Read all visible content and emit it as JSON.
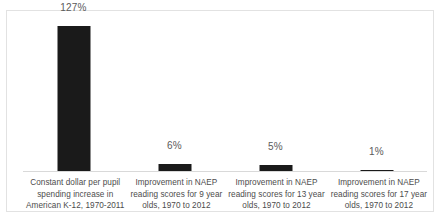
{
  "chart_data": {
    "type": "bar",
    "title": "",
    "subtitle": "",
    "xlabel": "",
    "ylabel": "",
    "grid": false,
    "legend": false,
    "axis_line": true,
    "value_labels": true,
    "ylim": [
      0,
      140
    ],
    "bar_color": "#1a1a1a",
    "label_color": "#5a5a5a",
    "axis_color": "#d9d9d9",
    "frame_color": "#e2e2e2",
    "categories": [
      "Constant dollar per pupil spending increase in American K-12, 1970-2011",
      "Improvement in NAEP reading scores for 9 year olds, 1970 to 2012",
      "Improvement in NAEP reading scores for 13 year olds, 1970 to 2012",
      "Improvement in NAEP reading scores for 17 year olds, 1970 to 2012"
    ],
    "category_lines": [
      [
        "Constant dollar per pupil",
        "spending increase in",
        "American K-12, 1970-2011"
      ],
      [
        "Improvement in NAEP",
        "reading scores for 9 year",
        "olds, 1970 to 2012"
      ],
      [
        "Improvement in NAEP",
        "reading scores for 13 year",
        "olds, 1970 to 2012"
      ],
      [
        "Improvement in NAEP",
        "reading scores for 17 year",
        "olds, 1970 to 2012"
      ]
    ],
    "values": [
      127,
      6,
      5,
      1
    ],
    "value_labels_text": [
      "127%",
      "6%",
      "5%",
      "1%"
    ]
  },
  "bars": [
    {
      "value_label": "127%",
      "line1": "Constant dollar per pupil",
      "line2": "spending increase in",
      "line3": "American K-12, 1970-2011"
    },
    {
      "value_label": "6%",
      "line1": "Improvement in NAEP",
      "line2": "reading scores for 9 year",
      "line3": "olds, 1970 to 2012"
    },
    {
      "value_label": "5%",
      "line1": "Improvement in NAEP",
      "line2": "reading scores for 13 year",
      "line3": "olds, 1970 to 2012"
    },
    {
      "value_label": "1%",
      "line1": "Improvement in NAEP",
      "line2": "reading scores for 17 year",
      "line3": "olds, 1970 to 2012"
    }
  ]
}
